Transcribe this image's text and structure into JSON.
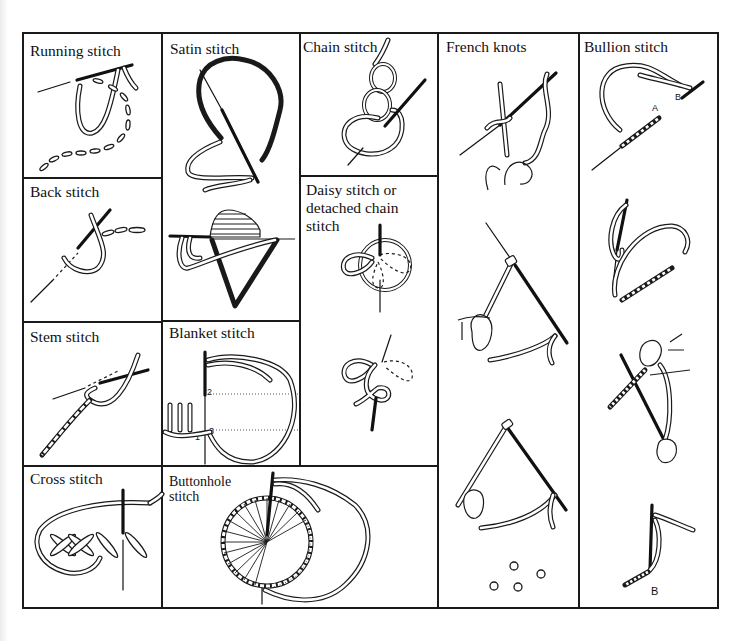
{
  "chart_title": "",
  "cells": {
    "running": {
      "label": "Running stitch"
    },
    "satin": {
      "label": "Satin stitch"
    },
    "chain": {
      "label": "Chain stitch"
    },
    "french": {
      "label": "French knots"
    },
    "bullion": {
      "label": "Bullion stitch",
      "marks": [
        "A",
        "B",
        "B"
      ]
    },
    "back": {
      "label": "Back stitch"
    },
    "daisy": {
      "label_lines": [
        "Daisy stitch or",
        "detached chain",
        "stitch"
      ]
    },
    "stem": {
      "label": "Stem stitch"
    },
    "blanket": {
      "label": "Blanket stitch",
      "marks": [
        "1",
        "2",
        "3"
      ]
    },
    "cross": {
      "label": "Cross stitch"
    },
    "buttonhole": {
      "label_lines": [
        "Buttonhole",
        "stitch"
      ]
    }
  },
  "colors": {
    "ink": "#1a1a1a",
    "paper": "#ffffff"
  }
}
